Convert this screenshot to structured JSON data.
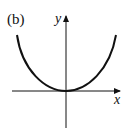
{
  "figure": {
    "panel_label": "(b)",
    "x_axis_label": "x",
    "y_axis_label": "y",
    "curve": {
      "shape": "parabola-up",
      "vertex_at_origin": true,
      "color": "#111111"
    },
    "axis_color": "#111111"
  }
}
